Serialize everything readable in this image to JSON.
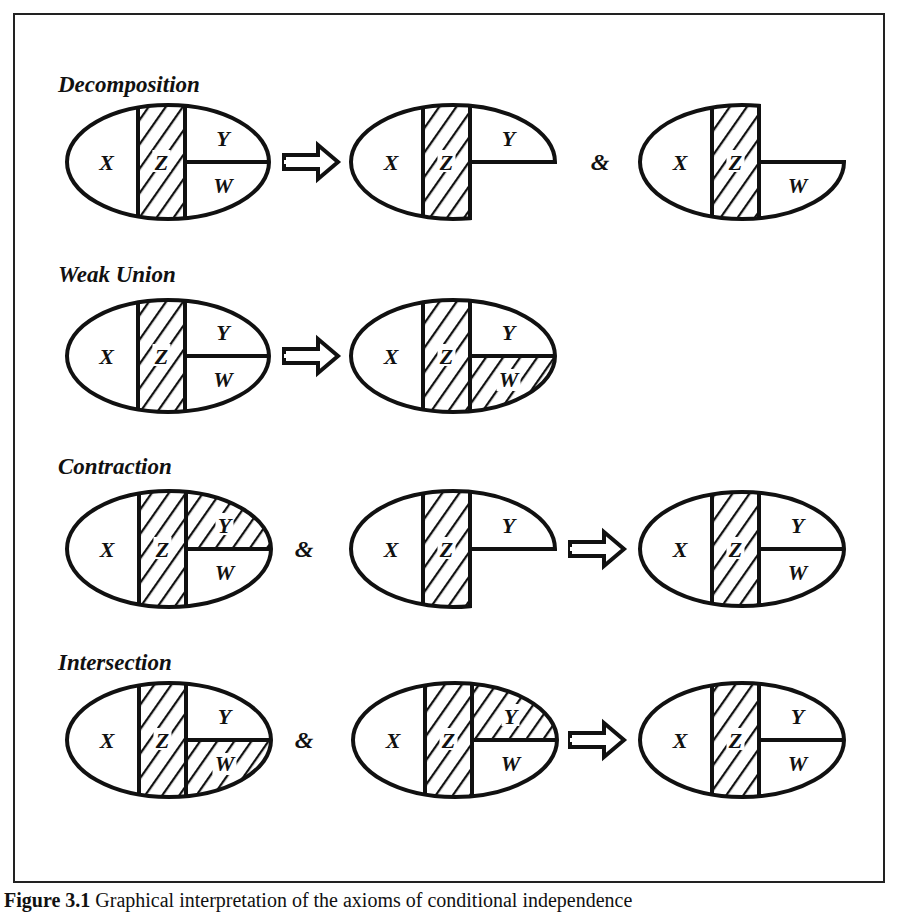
{
  "figure": {
    "caption_number": "Figure 3.1",
    "caption_text": "Graphical interpretation of the axioms of conditional independence",
    "colors": {
      "stroke": "#111111",
      "background": "#ffffff",
      "border": "#222222"
    },
    "symbols": {
      "implies": "⇒",
      "and": "&"
    },
    "region_labels": {
      "x": "X",
      "z": "Z",
      "y": "Y",
      "w": "W"
    },
    "rows": [
      {
        "title": "Decomposition",
        "title_pos": [
          58,
          72
        ],
        "cy": 162,
        "items": [
          {
            "type": "ellipse",
            "cx": 168,
            "rx": 101,
            "ry": 57,
            "shape": "full",
            "hatch": [
              "z"
            ]
          },
          {
            "type": "arrow",
            "x": 284
          },
          {
            "type": "ellipse",
            "cx": 453,
            "rx": 102,
            "ry": 57,
            "shape": "top-only",
            "hatch": [
              "z"
            ]
          },
          {
            "type": "and",
            "x": 600
          },
          {
            "type": "ellipse",
            "cx": 742,
            "rx": 102,
            "ry": 57,
            "shape": "bottom-only",
            "hatch": [
              "z"
            ]
          }
        ]
      },
      {
        "title": "Weak Union",
        "title_pos": [
          58,
          262
        ],
        "cy": 356,
        "items": [
          {
            "type": "ellipse",
            "cx": 168,
            "rx": 101,
            "ry": 56,
            "shape": "full",
            "hatch": [
              "z"
            ]
          },
          {
            "type": "arrow",
            "x": 284
          },
          {
            "type": "ellipse",
            "cx": 453,
            "rx": 102,
            "ry": 56,
            "shape": "full",
            "hatch": [
              "z",
              "w"
            ]
          }
        ]
      },
      {
        "title": "Contraction",
        "title_pos": [
          58,
          454
        ],
        "cy": 549,
        "items": [
          {
            "type": "ellipse",
            "cx": 169,
            "rx": 102,
            "ry": 58,
            "shape": "full",
            "hatch": [
              "z",
              "y"
            ]
          },
          {
            "type": "and",
            "x": 304
          },
          {
            "type": "ellipse",
            "cx": 453,
            "rx": 102,
            "ry": 58,
            "shape": "top-only",
            "hatch": [
              "z"
            ]
          },
          {
            "type": "arrow",
            "x": 570
          },
          {
            "type": "ellipse",
            "cx": 742,
            "rx": 102,
            "ry": 57,
            "shape": "full",
            "hatch": [
              "z"
            ]
          }
        ]
      },
      {
        "title": "Intersection",
        "title_pos": [
          58,
          650
        ],
        "cy": 740,
        "items": [
          {
            "type": "ellipse",
            "cx": 169,
            "rx": 102,
            "ry": 57,
            "shape": "full",
            "hatch": [
              "z",
              "w"
            ]
          },
          {
            "type": "and",
            "x": 304
          },
          {
            "type": "ellipse",
            "cx": 455,
            "rx": 102,
            "ry": 57,
            "shape": "full",
            "hatch": [
              "z",
              "y"
            ]
          },
          {
            "type": "arrow",
            "x": 570
          },
          {
            "type": "ellipse",
            "cx": 742,
            "rx": 102,
            "ry": 57,
            "shape": "full",
            "hatch": [
              "z"
            ]
          }
        ]
      }
    ]
  }
}
